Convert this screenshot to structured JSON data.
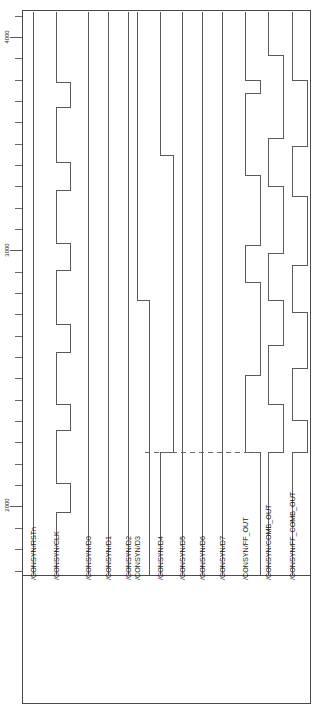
{
  "view": {
    "title": "CONSYN waveform viewer",
    "orientation": "rotated-90",
    "background_color": "#ffffff",
    "trace_color": "#5a5a5a",
    "frame_color": "#4a4a4a",
    "cursor_color": "#6a6a6a"
  },
  "axis": {
    "name": "time-axis",
    "orientation": "vertical",
    "tick_labels": [
      "4000",
      "3000",
      "2000"
    ],
    "tick_label_positions_px": [
      37,
      250,
      505
    ],
    "minor_tick_count": 26
  },
  "cursor": {
    "name": "measurement-cursor",
    "label": "",
    "position_px": 452,
    "style": "dashed"
  },
  "signals": [
    {
      "name": "/CONSYN/RSTn",
      "id": "rstn",
      "x": 33,
      "low_offset": 0,
      "transitions": []
    },
    {
      "name": "/CONSYN/CLK",
      "id": "clk",
      "x": 56,
      "low_offset": 14,
      "transitions": [
        82,
        107,
        162,
        190,
        243,
        270,
        324,
        352,
        404,
        430,
        483,
        512
      ]
    },
    {
      "name": "/CONSYN/D0",
      "id": "d0",
      "x": 88,
      "low_offset": 0,
      "transitions": []
    },
    {
      "name": "/CONSYN/D1",
      "id": "d1",
      "x": 108,
      "low_offset": 0,
      "transitions": []
    },
    {
      "name": "/CONSYN/D2",
      "id": "d2",
      "x": 128,
      "low_offset": 0,
      "transitions": []
    },
    {
      "name": "/CONSYN/D3",
      "id": "d3",
      "x": 137,
      "low_offset": 12,
      "transitions": [
        300
      ]
    },
    {
      "name": "/CONSYN/D4",
      "id": "d4",
      "x": 160,
      "low_offset": 13,
      "transitions": [
        155,
        452
      ]
    },
    {
      "name": "/CONSYN/D5",
      "id": "d5",
      "x": 182,
      "low_offset": 0,
      "transitions": []
    },
    {
      "name": "/CONSYN/D6",
      "id": "d6",
      "x": 202,
      "low_offset": 0,
      "transitions": []
    },
    {
      "name": "/CONSYN/D7",
      "id": "d7",
      "x": 222,
      "low_offset": 0,
      "transitions": []
    },
    {
      "name": "/CONSYN/FF_OUT",
      "id": "ff_out",
      "x": 245,
      "low_offset": 15,
      "transitions": [
        80,
        93,
        175,
        245,
        282,
        375,
        452
      ]
    },
    {
      "name": "/CONSYN/COMB_OUT",
      "id": "comb_out",
      "x": 268,
      "low_offset": 15,
      "transitions": [
        55,
        138,
        186,
        253,
        300,
        345,
        404,
        452
      ]
    },
    {
      "name": "/CONSYN/FF_COMB_OUT",
      "id": "ffc_out",
      "x": 292,
      "low_offset": 15,
      "transitions": [
        80,
        146,
        196,
        265,
        312,
        368,
        420,
        452
      ]
    }
  ],
  "plot": {
    "left": 22,
    "right": 310,
    "top": 10,
    "bottom": 575,
    "label_area_top": 578,
    "label_area_bottom": 703
  }
}
